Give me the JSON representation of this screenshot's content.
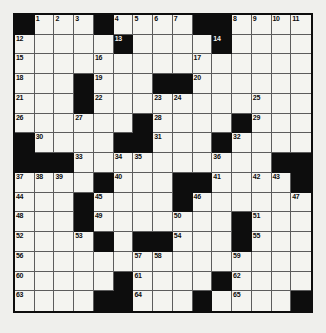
{
  "puzzle": {
    "type": "crossword-grid",
    "rows": 15,
    "cols": 15,
    "colors": {
      "block": "#0d0d0d",
      "fill": "#f4f4f0",
      "gridline": "#5c5c5c",
      "page_background": "#efefec",
      "number_text": "#0d0d0d"
    },
    "grid": [
      "#...#....##....",
      ".....#....#....",
      "...............",
      "...#...##......",
      "...#...........",
      "......#....#...",
      "#....##...#....",
      "###..........##",
      "....#...##....#",
      "...#....#......",
      "...#.......#...",
      "....#.##...#...",
      "...............",
      ".....#....#....",
      "....##...#....#"
    ],
    "numbers": [
      {
        "row": 0,
        "col": 1,
        "n": "1"
      },
      {
        "row": 0,
        "col": 2,
        "n": "2"
      },
      {
        "row": 0,
        "col": 3,
        "n": "3"
      },
      {
        "row": 0,
        "col": 5,
        "n": "4"
      },
      {
        "row": 0,
        "col": 6,
        "n": "5"
      },
      {
        "row": 0,
        "col": 7,
        "n": "6"
      },
      {
        "row": 0,
        "col": 8,
        "n": "7"
      },
      {
        "row": 0,
        "col": 11,
        "n": "8"
      },
      {
        "row": 0,
        "col": 12,
        "n": "9"
      },
      {
        "row": 0,
        "col": 13,
        "n": "10"
      },
      {
        "row": 0,
        "col": 14,
        "n": "11"
      },
      {
        "row": 1,
        "col": 0,
        "n": "12"
      },
      {
        "row": 1,
        "col": 5,
        "n": "13"
      },
      {
        "row": 1,
        "col": 10,
        "n": "14"
      },
      {
        "row": 2,
        "col": 0,
        "n": "15"
      },
      {
        "row": 2,
        "col": 4,
        "n": "16"
      },
      {
        "row": 2,
        "col": 9,
        "n": "17"
      },
      {
        "row": 3,
        "col": 0,
        "n": "18"
      },
      {
        "row": 3,
        "col": 4,
        "n": "19"
      },
      {
        "row": 3,
        "col": 9,
        "n": "20"
      },
      {
        "row": 4,
        "col": 0,
        "n": "21"
      },
      {
        "row": 4,
        "col": 4,
        "n": "22"
      },
      {
        "row": 4,
        "col": 7,
        "n": "23"
      },
      {
        "row": 4,
        "col": 8,
        "n": "24"
      },
      {
        "row": 4,
        "col": 12,
        "n": "25"
      },
      {
        "row": 5,
        "col": 0,
        "n": "26"
      },
      {
        "row": 5,
        "col": 3,
        "n": "27"
      },
      {
        "row": 5,
        "col": 7,
        "n": "28"
      },
      {
        "row": 5,
        "col": 12,
        "n": "29"
      },
      {
        "row": 6,
        "col": 1,
        "n": "30"
      },
      {
        "row": 6,
        "col": 7,
        "n": "31"
      },
      {
        "row": 6,
        "col": 11,
        "n": "32"
      },
      {
        "row": 7,
        "col": 3,
        "n": "33"
      },
      {
        "row": 7,
        "col": 5,
        "n": "34"
      },
      {
        "row": 7,
        "col": 6,
        "n": "35"
      },
      {
        "row": 7,
        "col": 10,
        "n": "36"
      },
      {
        "row": 8,
        "col": 0,
        "n": "37"
      },
      {
        "row": 8,
        "col": 1,
        "n": "38"
      },
      {
        "row": 8,
        "col": 2,
        "n": "39"
      },
      {
        "row": 8,
        "col": 5,
        "n": "40"
      },
      {
        "row": 8,
        "col": 10,
        "n": "41"
      },
      {
        "row": 8,
        "col": 12,
        "n": "42"
      },
      {
        "row": 8,
        "col": 13,
        "n": "43"
      },
      {
        "row": 9,
        "col": 0,
        "n": "44"
      },
      {
        "row": 9,
        "col": 4,
        "n": "45"
      },
      {
        "row": 9,
        "col": 9,
        "n": "46"
      },
      {
        "row": 9,
        "col": 14,
        "n": "47"
      },
      {
        "row": 10,
        "col": 0,
        "n": "48"
      },
      {
        "row": 10,
        "col": 4,
        "n": "49"
      },
      {
        "row": 10,
        "col": 8,
        "n": "50"
      },
      {
        "row": 10,
        "col": 12,
        "n": "51"
      },
      {
        "row": 11,
        "col": 0,
        "n": "52"
      },
      {
        "row": 11,
        "col": 3,
        "n": "53"
      },
      {
        "row": 11,
        "col": 8,
        "n": "54"
      },
      {
        "row": 11,
        "col": 12,
        "n": "55"
      },
      {
        "row": 12,
        "col": 0,
        "n": "56"
      },
      {
        "row": 12,
        "col": 6,
        "n": "57"
      },
      {
        "row": 12,
        "col": 7,
        "n": "58"
      },
      {
        "row": 12,
        "col": 11,
        "n": "59"
      },
      {
        "row": 13,
        "col": 0,
        "n": "60"
      },
      {
        "row": 13,
        "col": 6,
        "n": "61"
      },
      {
        "row": 13,
        "col": 11,
        "n": "62"
      },
      {
        "row": 14,
        "col": 0,
        "n": "63"
      },
      {
        "row": 14,
        "col": 6,
        "n": "64"
      },
      {
        "row": 14,
        "col": 11,
        "n": "65"
      }
    ]
  }
}
